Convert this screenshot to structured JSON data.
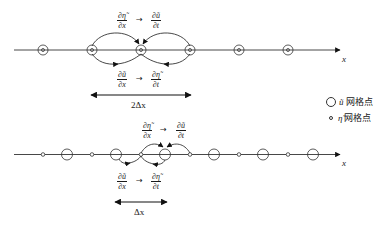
{
  "diagram": {
    "top_panel": {
      "grid_spacing_label": "2Δx",
      "upper_annotation": {
        "lhs_num": "∂η̃",
        "lhs_den": "∂x",
        "arrow": "→",
        "rhs_num": "∂ũ",
        "rhs_den": "∂t"
      },
      "lower_annotation": {
        "lhs_num": "∂ũ",
        "lhs_den": "∂x",
        "arrow": "→",
        "rhs_num": "∂η̃",
        "rhs_den": "∂t"
      },
      "axis_label": "x",
      "points_x": [
        43,
        92,
        141,
        190,
        239,
        288
      ],
      "point_type": "co-located ũ and η̃ (circle with dot)"
    },
    "bottom_panel": {
      "grid_spacing_label": "Δx",
      "upper_annotation": {
        "lhs_num": "∂η̃",
        "lhs_den": "∂x",
        "arrow": "→",
        "rhs_num": "∂ũ",
        "rhs_den": "∂t"
      },
      "lower_annotation": {
        "lhs_num": "∂ũ",
        "lhs_den": "∂x",
        "arrow": "→",
        "rhs_num": "∂η̃",
        "rhs_den": "∂t"
      },
      "axis_label": "x",
      "eta_points_x": [
        43,
        92,
        141,
        190,
        239,
        288
      ],
      "u_points_x": [
        67,
        116,
        165,
        214,
        263,
        313
      ],
      "point_type": "staggered grid"
    },
    "legend": [
      {
        "symbol": "large-circle",
        "variable": "ũ",
        "label": "网格点"
      },
      {
        "symbol": "small-circle",
        "variable": "η̃",
        "label": "网格点"
      }
    ]
  }
}
